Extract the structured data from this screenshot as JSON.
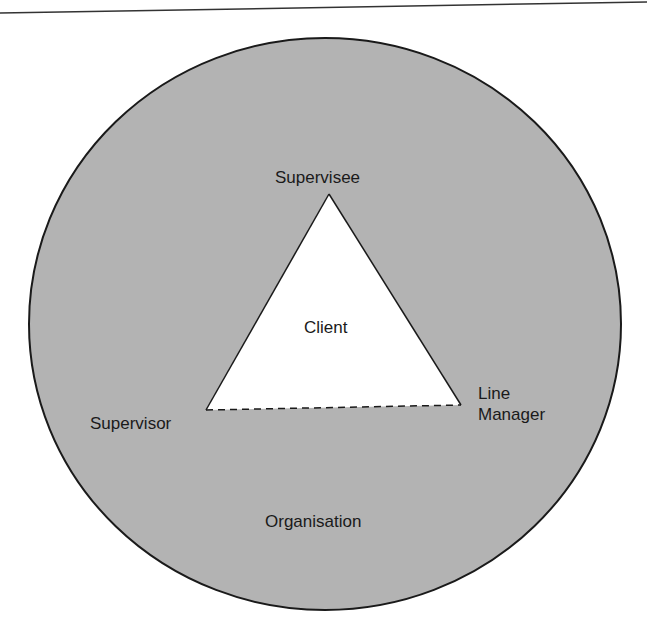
{
  "diagram": {
    "outer_circle_label": "Organisation",
    "inner_triangle_label": "Client",
    "vertices": {
      "top": "Supervisee",
      "bottom_left": "Supervisor",
      "bottom_right_line1": "Line",
      "bottom_right_line2": "Manager"
    },
    "edges": [
      {
        "from": "Supervisee",
        "to": "Supervisor",
        "style": "solid"
      },
      {
        "from": "Supervisee",
        "to": "Line Manager",
        "style": "solid"
      },
      {
        "from": "Supervisor",
        "to": "Line Manager",
        "style": "dashed"
      }
    ],
    "colors": {
      "circle_fill": "#b3b3b3",
      "stroke": "#1a1a1a",
      "triangle_fill": "#ffffff"
    }
  }
}
